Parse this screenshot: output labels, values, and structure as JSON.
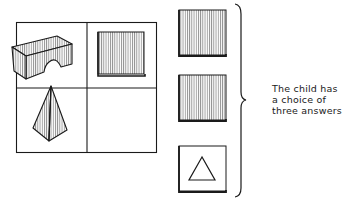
{
  "diagram": {
    "type": "matrix-completion-test",
    "grid": {
      "rows": 2,
      "cols": 2,
      "cells": [
        {
          "position": "top-left",
          "content": "arch-block"
        },
        {
          "position": "top-right",
          "content": "shaded-square-tile"
        },
        {
          "position": "bottom-left",
          "content": "pyramid"
        },
        {
          "position": "bottom-right",
          "content": "empty"
        }
      ]
    },
    "answers": [
      {
        "index": 1,
        "content": "shaded-square-tile"
      },
      {
        "index": 2,
        "content": "shaded-square-tile"
      },
      {
        "index": 3,
        "content": "square-tile-with-triangle"
      }
    ],
    "caption_lines": [
      "The child has",
      "a choice of",
      "three answers"
    ]
  },
  "colors": {
    "ink": "#1a1a1a",
    "background": "#ffffff"
  }
}
